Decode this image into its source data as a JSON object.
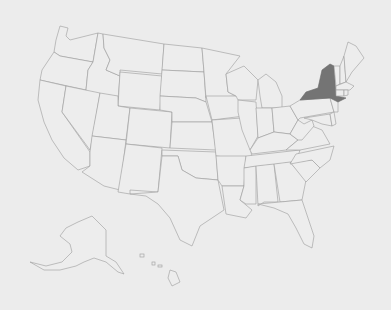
{
  "map": {
    "subject": "United States",
    "highlighted_states": [
      "New York"
    ],
    "colors": {
      "background": "#ececec",
      "state_fill": "#ededed",
      "state_border": "#9a9a9a",
      "highlight_fill": "#747474"
    },
    "insets": [
      "Alaska",
      "Hawaii"
    ]
  }
}
